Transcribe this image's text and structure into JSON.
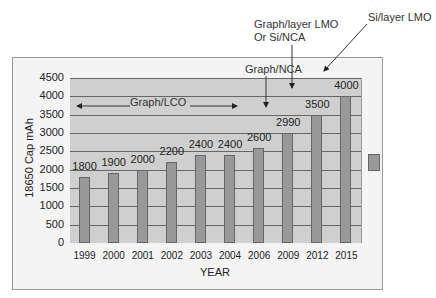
{
  "chart_data": {
    "type": "bar",
    "title": "",
    "xlabel": "YEAR",
    "ylabel": "18650 Cap mAh",
    "ylim": [
      0,
      4500
    ],
    "yticks": [
      0,
      500,
      1000,
      1500,
      2000,
      2500,
      3000,
      3500,
      4000,
      4500
    ],
    "categories": [
      "1999",
      "2000",
      "2001",
      "2002",
      "2003",
      "2004",
      "2006",
      "2009",
      "2012",
      "2015"
    ],
    "values": [
      1800,
      1900,
      2000,
      2200,
      2400,
      2400,
      2600,
      2990,
      3500,
      4000
    ],
    "data_labels": [
      "1800",
      "1900",
      "2000",
      "2200",
      "2400",
      "2400",
      "2600",
      "2990",
      "3500",
      "4000"
    ],
    "grid": true,
    "legend_position": "right",
    "annotations": [
      {
        "text": "Graph/LCO",
        "span": [
          "1999",
          "2006"
        ],
        "type": "double-arrow"
      },
      {
        "text": "Graph/NCA",
        "points_to": "2009"
      },
      {
        "text": "Graph/layer LMO Or Si/NCA",
        "points_to": "2012"
      },
      {
        "text": "Si/layer LMO",
        "points_to": "2015"
      }
    ]
  },
  "labels": {
    "ylabel": "18650 Cap mAh",
    "xlabel": "YEAR",
    "ann_lco": "Graph/LCO",
    "ann_nca": "Graph/NCA",
    "ann_lmo1": "Graph/layer LMO",
    "ann_lmo2": "Or Si/NCA",
    "ann_si": "Si/layer LMO"
  }
}
